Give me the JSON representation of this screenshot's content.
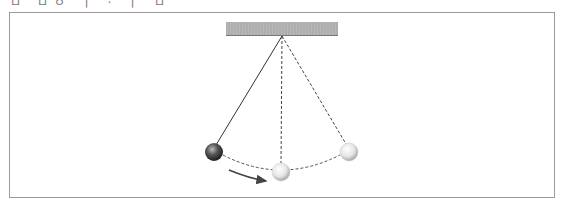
{
  "caption": {
    "text": "ㅁ ㅁㅇ ㅣ · ㅣ ㅁ"
  },
  "diagram": {
    "ceiling": {
      "x": 226,
      "y": 22,
      "width": 112,
      "height": 14,
      "color": "#b5b5b5"
    },
    "pivot": {
      "x": 282,
      "y": 36
    },
    "string_solid_color": "#333333",
    "string_dashed_color": "#444444",
    "balls": [
      {
        "name": "start-position",
        "cx": 214,
        "cy": 152,
        "r": 9,
        "style": "dark"
      },
      {
        "name": "bottom-position",
        "cx": 281,
        "cy": 172,
        "r": 9,
        "style": "light"
      },
      {
        "name": "end-position",
        "cx": 349,
        "cy": 152,
        "r": 9,
        "style": "light"
      }
    ],
    "arrow": {
      "from": [
        228,
        170
      ],
      "to": [
        268,
        181
      ],
      "meaning": "direction of swing"
    }
  }
}
